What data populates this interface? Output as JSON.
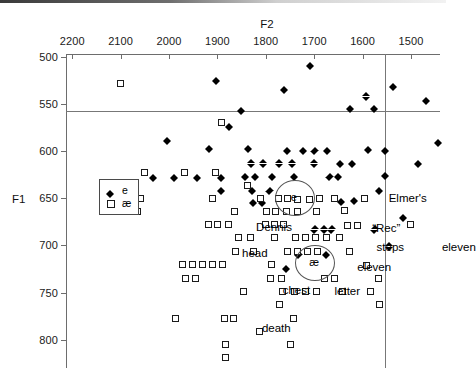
{
  "chart_data": {
    "type": "scatter",
    "title": "",
    "xlabel": "F2",
    "ylabel": "F1",
    "xlim": [
      2250,
      1440
    ],
    "ylim": [
      830,
      495
    ],
    "x_reversed": true,
    "y_reversed": true,
    "grid": false,
    "legend_position": "left-middle",
    "xticks": [
      2200,
      2100,
      2000,
      1900,
      1800,
      1700,
      1600,
      1500
    ],
    "xtick_labels": [
      "2200",
      "2100",
      "2000",
      "1900",
      "1800",
      "1700",
      "1600",
      "1500"
    ],
    "yticks": [
      500,
      550,
      600,
      650,
      700,
      750,
      800
    ],
    "ytick_labels": [
      "500",
      "550",
      "600",
      "650",
      "700",
      "750",
      "800"
    ],
    "reference_lines": [
      {
        "orientation": "horizontal",
        "value": 558,
        "label": ""
      },
      {
        "orientation": "vertical",
        "value": 1553,
        "label": ""
      }
    ],
    "series": [
      {
        "name": "e",
        "marker": "filled-diamond",
        "color": "#000000",
        "points": [
          [
            1708,
            506
          ],
          [
            1903,
            522
          ],
          [
            1762,
            531
          ],
          [
            1536,
            528
          ],
          [
            1592,
            538
          ],
          [
            1851,
            553
          ],
          [
            1626,
            551
          ],
          [
            1577,
            551
          ],
          [
            1469,
            543
          ],
          [
            1875,
            570
          ],
          [
            2003,
            585
          ],
          [
            1444,
            587
          ],
          [
            1917,
            594
          ],
          [
            1837,
            594
          ],
          [
            1756,
            596
          ],
          [
            1723,
            596
          ],
          [
            1699,
            596
          ],
          [
            1674,
            596
          ],
          [
            1588,
            595
          ],
          [
            1553,
            596
          ],
          [
            1830,
            609
          ],
          [
            1806,
            609
          ],
          [
            1772,
            609
          ],
          [
            1745,
            609
          ],
          [
            1700,
            609
          ],
          [
            1646,
            610
          ],
          [
            1621,
            610
          ],
          [
            1486,
            610
          ],
          [
            2033,
            624
          ],
          [
            1990,
            624
          ],
          [
            1941,
            624
          ],
          [
            1893,
            624
          ],
          [
            1843,
            623
          ],
          [
            1822,
            623
          ],
          [
            1786,
            623
          ],
          [
            1742,
            623
          ],
          [
            1668,
            623
          ],
          [
            1650,
            623
          ],
          [
            1553,
            622
          ],
          [
            1892,
            638
          ],
          [
            1828,
            638
          ],
          [
            1792,
            638
          ],
          [
            1566,
            638
          ],
          [
            1826,
            651
          ],
          [
            1808,
            651
          ],
          [
            1644,
            650
          ],
          [
            1617,
            649
          ],
          [
            1699,
            679
          ],
          [
            1679,
            679
          ],
          [
            1664,
            679
          ],
          [
            1575,
            679
          ],
          [
            1732,
            706
          ],
          [
            1676,
            706
          ],
          [
            1545,
            697
          ],
          [
            1757,
            721
          ],
          [
            1517,
            667
          ]
        ]
      },
      {
        "name": "ae",
        "marker": "open-square",
        "color": "#1b1b1b",
        "points": [
          [
            2100,
            528
          ],
          [
            1891,
            570
          ],
          [
            2051,
            623
          ],
          [
            1968,
            623
          ],
          [
            1903,
            623
          ],
          [
            1838,
            637
          ],
          [
            2059,
            650
          ],
          [
            1910,
            650
          ],
          [
            1810,
            650
          ],
          [
            1774,
            650
          ],
          [
            1756,
            650
          ],
          [
            1734,
            651
          ],
          [
            1709,
            651
          ],
          [
            1688,
            650
          ],
          [
            1657,
            650
          ],
          [
            1597,
            650
          ],
          [
            2066,
            664
          ],
          [
            1865,
            664
          ],
          [
            1798,
            664
          ],
          [
            1779,
            664
          ],
          [
            1758,
            664
          ],
          [
            1735,
            664
          ],
          [
            1696,
            664
          ],
          [
            1637,
            663
          ],
          [
            1918,
            678
          ],
          [
            1899,
            678
          ],
          [
            1877,
            678
          ],
          [
            1800,
            678
          ],
          [
            1782,
            678
          ],
          [
            1764,
            678
          ],
          [
            1631,
            679
          ],
          [
            1611,
            679
          ],
          [
            1500,
            678
          ],
          [
            1857,
            692
          ],
          [
            1832,
            692
          ],
          [
            1783,
            692
          ],
          [
            1738,
            692
          ],
          [
            1717,
            692
          ],
          [
            1697,
            692
          ],
          [
            1675,
            692
          ],
          [
            1648,
            692
          ],
          [
            1862,
            706
          ],
          [
            1826,
            706
          ],
          [
            1755,
            706
          ],
          [
            1734,
            706
          ],
          [
            1713,
            706
          ],
          [
            1694,
            706
          ],
          [
            1627,
            706
          ],
          [
            1972,
            720
          ],
          [
            1951,
            720
          ],
          [
            1931,
            720
          ],
          [
            1910,
            720
          ],
          [
            1890,
            720
          ],
          [
            1788,
            720
          ],
          [
            1591,
            721
          ],
          [
            1966,
            735
          ],
          [
            1946,
            735
          ],
          [
            1791,
            735
          ],
          [
            1768,
            735
          ],
          [
            1678,
            735
          ],
          [
            1657,
            735
          ],
          [
            1568,
            735
          ],
          [
            1846,
            749
          ],
          [
            1765,
            749
          ],
          [
            1741,
            749
          ],
          [
            1718,
            749
          ],
          [
            1695,
            749
          ],
          [
            1641,
            749
          ],
          [
            1583,
            749
          ],
          [
            1772,
            763
          ],
          [
            1564,
            763
          ],
          [
            1986,
            777
          ],
          [
            1886,
            777
          ],
          [
            1866,
            777
          ],
          [
            1742,
            777
          ],
          [
            1813,
            791
          ],
          [
            1883,
            805
          ],
          [
            1749,
            805
          ],
          [
            1883,
            819
          ]
        ]
      }
    ],
    "clusters": [
      {
        "label": "e",
        "x": 1742,
        "y": 649,
        "rx_px": 19,
        "ry_px": 17
      },
      {
        "label": "æ",
        "x": 1700,
        "y": 718,
        "rx_px": 19,
        "ry_px": 17
      }
    ],
    "annotations": [
      {
        "text": "Elmer's",
        "x": 1546,
        "y": 651
      },
      {
        "text": "Dennis",
        "x": 1820,
        "y": 682
      },
      {
        "text": "head",
        "x": 1849,
        "y": 709
      },
      {
        "text": "“Rec”",
        "x": 1580,
        "y": 683
      },
      {
        "text": "steps",
        "x": 1571,
        "y": 703
      },
      {
        "text": "eleven",
        "x": 1611,
        "y": 724
      },
      {
        "text": "eleven",
        "x": 1436,
        "y": 703
      },
      {
        "text": "chest",
        "x": 1765,
        "y": 748
      },
      {
        "text": "letter",
        "x": 1658,
        "y": 749
      },
      {
        "text": "death",
        "x": 1808,
        "y": 789
      }
    ]
  },
  "legend": {
    "items": [
      {
        "symbol": "filled-diamond",
        "label": "e"
      },
      {
        "symbol": "open-square",
        "label": "æ"
      }
    ]
  }
}
